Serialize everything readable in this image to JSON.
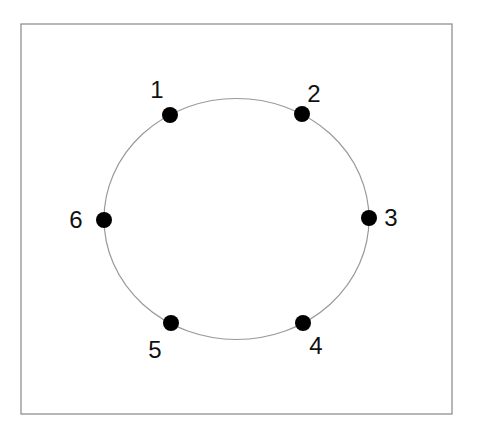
{
  "diagram": {
    "frame": {
      "x": 21,
      "y": 24,
      "width": 431,
      "height": 390,
      "stroke": "#888888"
    },
    "ring": {
      "cx": 236.5,
      "cy": 219,
      "rx": 132.5,
      "ry": 120.5,
      "stroke": "#999999"
    },
    "node_color": "#000000",
    "nodes": [
      {
        "id": "1",
        "label": "1",
        "cx": 170,
        "cy": 115,
        "lx": 157,
        "ly": 98
      },
      {
        "id": "2",
        "label": "2",
        "cx": 302,
        "cy": 114,
        "lx": 314,
        "ly": 102
      },
      {
        "id": "3",
        "label": "3",
        "cx": 369,
        "cy": 218,
        "lx": 391,
        "ly": 226
      },
      {
        "id": "4",
        "label": "4",
        "cx": 303,
        "cy": 323,
        "lx": 316,
        "ly": 354
      },
      {
        "id": "5",
        "label": "5",
        "cx": 171,
        "cy": 323,
        "lx": 155,
        "ly": 358
      },
      {
        "id": "6",
        "label": "6",
        "cx": 104,
        "cy": 220,
        "lx": 76,
        "ly": 228
      }
    ]
  }
}
